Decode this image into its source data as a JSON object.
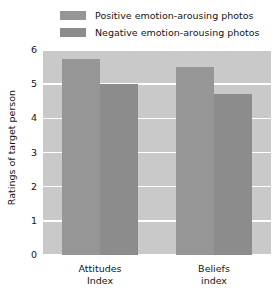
{
  "chart_data": {
    "type": "bar",
    "title": "",
    "xlabel": "",
    "ylabel": "Ratings of target person",
    "ylim": [
      0,
      6
    ],
    "yticks": [
      0,
      1,
      2,
      3,
      4,
      5,
      6
    ],
    "ytick_labels": [
      "0",
      "1",
      "2",
      "3",
      "4",
      "5",
      "6"
    ],
    "categories": [
      "Attitudes Index",
      "Beliefs index"
    ],
    "category_lines": [
      [
        "Attitudes",
        "Index"
      ],
      [
        "Beliefs",
        "index"
      ]
    ],
    "series": [
      {
        "name": "Positive emotion-arousing photos",
        "color": "#969696",
        "values": [
          5.75,
          5.5
        ]
      },
      {
        "name": "Negative emotion-arousing photos",
        "color": "#8c8c8c",
        "values": [
          5.0,
          4.7
        ]
      }
    ],
    "grid": true,
    "grid_color": "#ffffff",
    "plot_background": "#c9c9c9",
    "legend_position": "top"
  }
}
